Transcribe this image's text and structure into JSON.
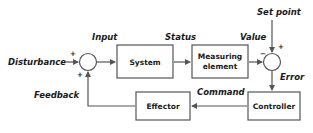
{
  "diagram": {
    "type": "feedback-control-loop",
    "blocks": {
      "system": "System",
      "measuring_line1": "Measuring",
      "measuring_line2": "element",
      "controller": "Controller",
      "effector": "Effector"
    },
    "signals": {
      "disturbance": "Disturbance",
      "input": "Input",
      "status": "Status",
      "value": "Value",
      "set_point": "Set point",
      "error": "Error",
      "command": "Command",
      "feedback": "Feedback"
    },
    "signs": {
      "junction1_disturbance": "+",
      "junction1_feedback": "+",
      "junction2_value": "−",
      "junction2_setpoint": "+"
    }
  }
}
